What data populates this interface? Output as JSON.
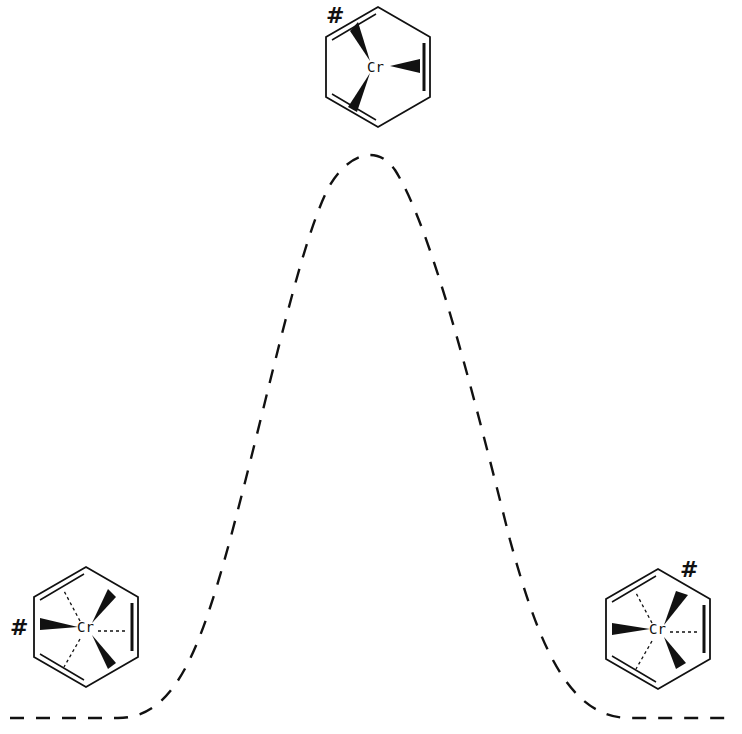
{
  "diagram": {
    "type": "energy-profile",
    "curve_style": "dashed",
    "color": "#111111",
    "structures": [
      {
        "id": "left",
        "position": "left-minimum",
        "metal_label": "Cr",
        "marker": "#"
      },
      {
        "id": "top",
        "position": "transition-state",
        "metal_label": "Cr",
        "marker": "#"
      },
      {
        "id": "right",
        "position": "right-minimum",
        "metal_label": "Cr",
        "marker": "#"
      }
    ]
  }
}
